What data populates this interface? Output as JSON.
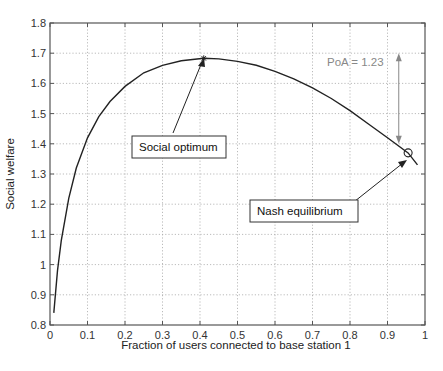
{
  "chart_data": {
    "type": "line",
    "title": "",
    "xlabel": "Fraction of users connected to base station 1",
    "ylabel": "Social welfare",
    "xlim": [
      0,
      1
    ],
    "ylim": [
      0.8,
      1.8
    ],
    "grid": true,
    "xticks": [
      "0",
      "0.1",
      "0.2",
      "0.3",
      "0.4",
      "0.5",
      "0.6",
      "0.7",
      "0.8",
      "0.9",
      "1"
    ],
    "yticks": [
      "0.8",
      "0.9",
      "1",
      "1.1",
      "1.2",
      "1.3",
      "1.4",
      "1.5",
      "1.6",
      "1.7",
      "1.8"
    ],
    "series": [
      {
        "name": "Social welfare",
        "x": [
          0.01,
          0.02,
          0.03,
          0.05,
          0.07,
          0.1,
          0.13,
          0.16,
          0.2,
          0.25,
          0.3,
          0.35,
          0.41,
          0.45,
          0.5,
          0.55,
          0.6,
          0.65,
          0.7,
          0.75,
          0.8,
          0.85,
          0.9,
          0.955,
          0.98
        ],
        "y": [
          0.84,
          0.98,
          1.08,
          1.22,
          1.32,
          1.42,
          1.49,
          1.54,
          1.59,
          1.635,
          1.66,
          1.675,
          1.683,
          1.681,
          1.673,
          1.66,
          1.64,
          1.615,
          1.585,
          1.55,
          1.51,
          1.465,
          1.42,
          1.37,
          1.33
        ]
      }
    ],
    "annotations": [
      {
        "text": "Social optimum",
        "point": [
          0.41,
          1.683
        ],
        "marker": "asterisk"
      },
      {
        "text": "Nash equilibrium",
        "point": [
          0.955,
          1.37
        ],
        "marker": "circle"
      },
      {
        "text": "PoA = 1.23",
        "type": "double-arrow",
        "x": 0.93,
        "y_range": [
          1.4,
          1.7
        ]
      }
    ],
    "legend": null
  },
  "labels": {
    "xlabel": "Fraction of users connected to base station 1",
    "ylabel": "Social welfare",
    "social_optimum": "Social optimum",
    "nash_equilibrium": "Nash equilibrium",
    "poa": "PoA = 1.23"
  }
}
